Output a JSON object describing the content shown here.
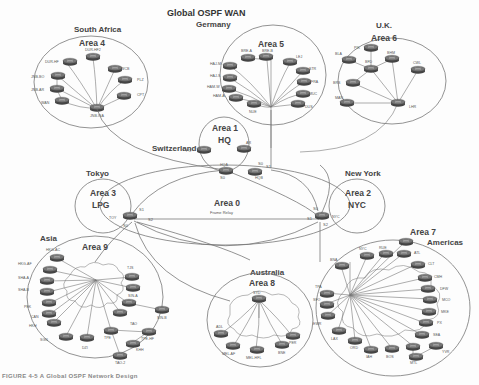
{
  "title": "Global OSPF WAN",
  "caption": "FIGURE 4-5 A Global OSPF Network Design",
  "areas": [
    {
      "id": "area4",
      "region": "South Africa",
      "label": "Area 4",
      "nodes": [
        "DUR-HF",
        "DUR-HF2",
        "JNB-BO",
        "JNB-AR",
        "WAN",
        "JNB-ISA",
        "WCB",
        "PLZ",
        "CPT"
      ]
    },
    {
      "id": "area5",
      "region": "Germany",
      "label": "Area 5",
      "nodes": [
        "BRE-A",
        "BRE-B",
        "LEJ",
        "HAJ-M",
        "HAJ-S",
        "HAM-W",
        "HAM-A",
        "NUE",
        "STR",
        "FRA",
        "MUC",
        "DUS"
      ]
    },
    {
      "id": "area6",
      "region": "U.K.",
      "label": "Area 6",
      "nodes": [
        "PIK",
        "BLA",
        "BFD",
        "BHM",
        "CWL",
        "BRS",
        "MAN",
        "LHR"
      ]
    },
    {
      "id": "area1",
      "region": "Switzerland",
      "label": "Area 1",
      "sublabel": "HQ",
      "nodes": [
        "PC",
        "AR",
        "HQA",
        "HQB"
      ]
    },
    {
      "id": "area3",
      "region": "Tokyo",
      "label": "Area 3",
      "sublabel": "LPG",
      "nodes": [
        "TOY"
      ]
    },
    {
      "id": "area2",
      "region": "New York",
      "label": "Area 2",
      "sublabel": "NYC",
      "nodes": [
        "NYC"
      ]
    },
    {
      "id": "area0",
      "label": "Area 0",
      "sublabel": "Frame Relay",
      "interfaces": [
        "S0",
        "S1",
        "S2"
      ]
    },
    {
      "id": "area9",
      "region": "Asia",
      "label": "Area 9",
      "nodes": [
        "HKG-AC",
        "HKG-AF",
        "SHA-A",
        "SHA-B",
        "PEK",
        "CAN",
        "HKH",
        "SGN",
        "ICN",
        "DZI",
        "TPE",
        "TPE-HF",
        "KHH",
        "TAO",
        "TAO-2",
        "TJS",
        "SIN-A",
        "SIN-B"
      ]
    },
    {
      "id": "area8",
      "region": "Australia",
      "label": "Area 8",
      "nodes": [
        "SYD",
        "ADL",
        "MEL-AF",
        "MEL-HFL",
        "BNE",
        "PER"
      ]
    },
    {
      "id": "area7",
      "region": "Americas",
      "label": "Area 7",
      "nodes": [
        "NYC",
        "RUE",
        "ATL",
        "CLT",
        "CMH",
        "DFW",
        "MCO",
        "MKE",
        "PX",
        "SEA",
        "YVR",
        "MTL",
        "BOS",
        "IAH",
        "ORD",
        "LAX",
        "EWR",
        "SFO",
        "TPA",
        "BNA",
        "DEN"
      ]
    }
  ],
  "interfaces": {
    "s0": "S0",
    "s1": "S1",
    "s2": "S2"
  }
}
